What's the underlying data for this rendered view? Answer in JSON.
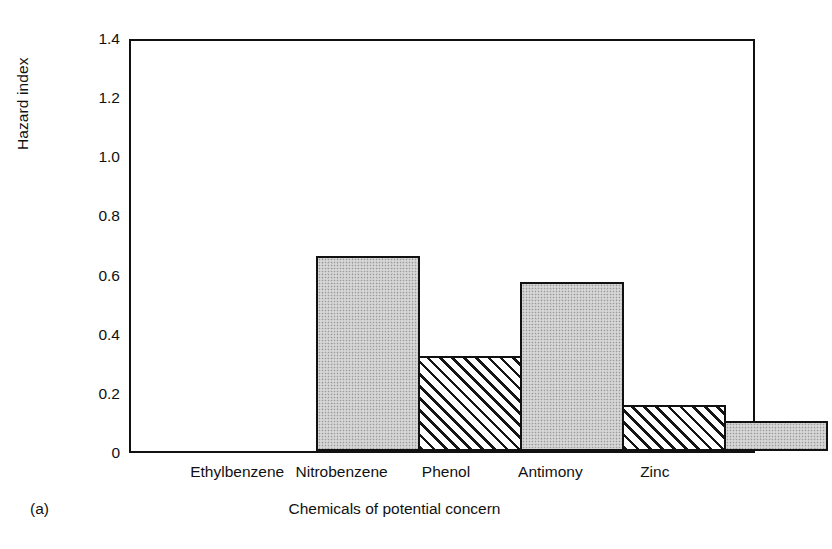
{
  "figure": {
    "panel_caption": "(a)",
    "axis_color": "#111111",
    "bar_fill_gray": "#c9c9c9",
    "bar_fill_hatch": "#ffffff"
  },
  "chart_data": {
    "type": "bar",
    "title": "",
    "xlabel": "Chemicals of potential concern",
    "ylabel": "Hazard index",
    "categories": [
      "Ethylbenzene",
      "Nitrobenzene",
      "Phenol",
      "Antimony",
      "Zinc"
    ],
    "values": [
      0.66,
      0.32,
      0.57,
      0.155,
      0.1
    ],
    "series": [
      {
        "name": "Hazard index",
        "values": [
          0.66,
          0.32,
          0.57,
          0.155,
          0.1
        ],
        "patterns": [
          "stipple",
          "hatch",
          "stipple",
          "hatch",
          "stipple"
        ]
      }
    ],
    "ylim": [
      0,
      1.4
    ],
    "yticks": [
      0,
      0.2,
      0.4,
      0.6,
      0.8,
      1.0,
      1.2,
      1.4
    ],
    "ytick_labels": [
      "0",
      "0.2",
      "0.4",
      "0.6",
      "0.8",
      "1.0",
      "1.2",
      "1.4"
    ],
    "grid": false,
    "legend": null,
    "bar_gap": 0,
    "annotations": []
  }
}
